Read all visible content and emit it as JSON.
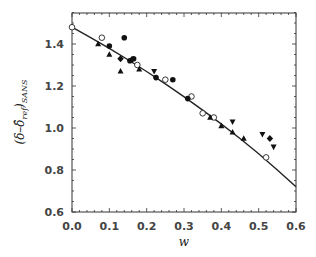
{
  "chart_data": {
    "type": "scatter",
    "title": "",
    "xlabel": "w",
    "ylabel": "(δ−δ̂_ref)_SANS",
    "ylabel_main": "(δ–δ̂",
    "ylabel_sub1": "ref",
    "ylabel_close": ")",
    "ylabel_sub2": "SANS",
    "xlim": [
      0.0,
      0.6
    ],
    "ylim": [
      0.6,
      1.55
    ],
    "xticks": [
      "0.0",
      "0.1",
      "0.2",
      "0.3",
      "0.4",
      "0.5",
      "0.6"
    ],
    "yticks": [
      "0.6",
      "0.8",
      "1.0",
      "1.2",
      "1.4"
    ],
    "grid": false,
    "legend": null,
    "series": [
      {
        "name": "open circles",
        "marker": "circle-open",
        "points": [
          [
            0.0,
            1.48
          ],
          [
            0.08,
            1.43
          ],
          [
            0.175,
            1.3
          ],
          [
            0.25,
            1.23
          ],
          [
            0.32,
            1.15
          ],
          [
            0.35,
            1.07
          ],
          [
            0.38,
            1.05
          ],
          [
            0.52,
            0.86
          ]
        ]
      },
      {
        "name": "filled circles",
        "marker": "circle-filled",
        "points": [
          [
            0.1,
            1.39
          ],
          [
            0.14,
            1.43
          ],
          [
            0.155,
            1.32
          ],
          [
            0.165,
            1.33
          ],
          [
            0.225,
            1.24
          ],
          [
            0.27,
            1.23
          ],
          [
            0.31,
            1.14
          ]
        ]
      },
      {
        "name": "filled triangles up",
        "marker": "triangle-up",
        "points": [
          [
            0.07,
            1.4
          ],
          [
            0.1,
            1.35
          ],
          [
            0.13,
            1.27
          ],
          [
            0.18,
            1.28
          ],
          [
            0.37,
            1.05
          ],
          [
            0.4,
            1.01
          ],
          [
            0.43,
            0.98
          ],
          [
            0.46,
            0.95
          ]
        ]
      },
      {
        "name": "filled triangles down",
        "marker": "triangle-down",
        "points": [
          [
            0.22,
            1.27
          ],
          [
            0.43,
            1.03
          ],
          [
            0.51,
            0.97
          ],
          [
            0.54,
            0.91
          ]
        ]
      },
      {
        "name": "filled diamonds",
        "marker": "diamond",
        "points": [
          [
            0.13,
            1.33
          ],
          [
            0.16,
            1.325
          ],
          [
            0.53,
            0.95
          ]
        ]
      },
      {
        "name": "fit curve",
        "marker": "line",
        "points": [
          [
            0.0,
            1.48
          ],
          [
            0.1,
            1.38
          ],
          [
            0.2,
            1.27
          ],
          [
            0.3,
            1.15
          ],
          [
            0.4,
            1.02
          ],
          [
            0.5,
            0.88
          ],
          [
            0.6,
            0.72
          ]
        ]
      }
    ]
  }
}
